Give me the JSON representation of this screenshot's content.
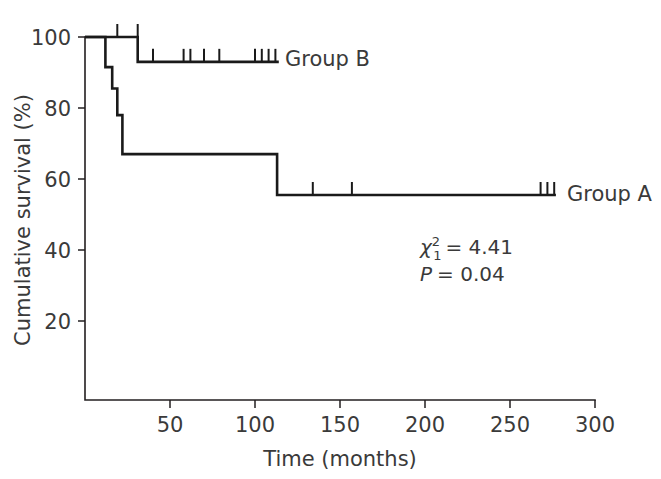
{
  "chart_data": {
    "type": "line",
    "title": "",
    "xlabel": "Time (months)",
    "ylabel": "Cumulative survival (%)",
    "xlim": [
      0,
      300
    ],
    "ylim": [
      0,
      105
    ],
    "xticks": [
      50,
      100,
      150,
      200,
      250,
      300
    ],
    "xtick_labels": [
      "50",
      "100",
      "150",
      "200",
      "250",
      "300"
    ],
    "yticks": [
      20,
      40,
      60,
      80,
      100
    ],
    "ytick_labels": [
      "20",
      "40",
      "60",
      "80",
      "100"
    ],
    "grid": false,
    "legend_position": "inline-right-of-curve",
    "series": [
      {
        "name": "Group A",
        "label": "Group A",
        "steps": [
          {
            "t": 0,
            "s": 100
          },
          {
            "t": 12,
            "s": 100
          },
          {
            "t": 12,
            "s": 91.5
          },
          {
            "t": 16,
            "s": 91.5
          },
          {
            "t": 16,
            "s": 85.5
          },
          {
            "t": 19,
            "s": 85.5
          },
          {
            "t": 19,
            "s": 78
          },
          {
            "t": 22,
            "s": 78
          },
          {
            "t": 22,
            "s": 67
          },
          {
            "t": 113,
            "s": 67
          },
          {
            "t": 113,
            "s": 55.5
          },
          {
            "t": 277,
            "s": 55.5
          }
        ],
        "censor_times": [
          134,
          157,
          268,
          272,
          276
        ]
      },
      {
        "name": "Group B",
        "label": "Group B",
        "steps": [
          {
            "t": 0,
            "s": 100
          },
          {
            "t": 31,
            "s": 100
          },
          {
            "t": 31,
            "s": 93
          },
          {
            "t": 114,
            "s": 93
          }
        ],
        "censor_times_upper": [
          19,
          31
        ],
        "censor_times": [
          40,
          58,
          62,
          70,
          79,
          100,
          104,
          108,
          112
        ]
      }
    ],
    "annotations": [
      {
        "id": "chi-square",
        "symbol": "χ",
        "superscript": "2",
        "subscript": "1",
        "relation": "=",
        "value": "4.41",
        "text": "χ²₁ = 4.41"
      },
      {
        "id": "p-value",
        "symbol": "P",
        "relation": "=",
        "value": "0.04",
        "text": "P = 0.04"
      }
    ],
    "colors": {
      "curve": "#1a1a1a",
      "axis": "#231f20",
      "text": "#3a3a3a",
      "background": "#ffffff"
    }
  },
  "labels": {
    "y_axis_title": "Cumulative survival (%)",
    "x_axis_title": "Time (months)",
    "group_a": "Group A",
    "group_b": "Group B",
    "ytick_100": "100",
    "ytick_80": "80",
    "ytick_60": "60",
    "ytick_40": "40",
    "ytick_20": "20",
    "xtick_50": "50",
    "xtick_100": "100",
    "xtick_150": "150",
    "xtick_200": "200",
    "xtick_250": "250",
    "xtick_300": "300",
    "chi_symbol": "χ",
    "chi_sup": "2",
    "chi_sub": "1",
    "chi_eq": "= 4.41",
    "p_symbol": "P",
    "p_eq": "= 0.04"
  }
}
